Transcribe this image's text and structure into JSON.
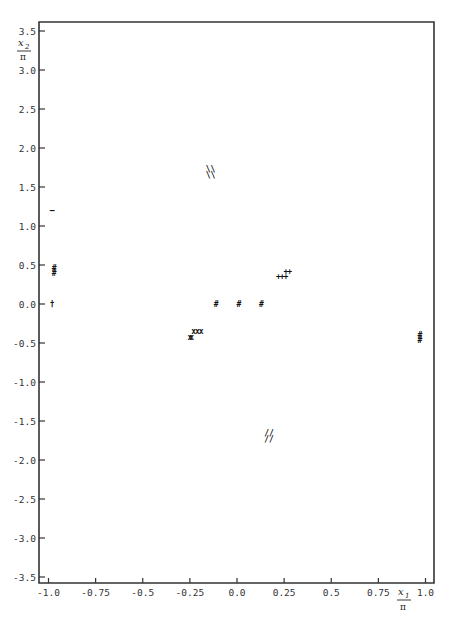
{
  "chart_data": {
    "type": "scatter",
    "title": "",
    "xlabel": "x1 / π",
    "ylabel": "x2 / π",
    "xlim": [
      -1.0,
      1.0
    ],
    "ylim": [
      -3.5,
      3.5
    ],
    "grid": false,
    "legend": null,
    "x_ticks": [
      "-1.0",
      "-0.75",
      "-0.5",
      "-0.25",
      "0.0",
      "0.25",
      "0.5",
      "0.75",
      "1.0"
    ],
    "x_tick_values": [
      -1.0,
      -0.75,
      -0.5,
      -0.25,
      0.0,
      0.25,
      0.5,
      0.75,
      1.0
    ],
    "y_ticks": [
      "3.5",
      "3.0",
      "2.5",
      "2.0",
      "1.5",
      "1.0",
      "0.5",
      "0.0",
      "-0.5",
      "-1.0",
      "-1.5",
      "-2.0",
      "-2.5",
      "-3.0",
      "-3.5"
    ],
    "y_tick_values": [
      3.5,
      3.0,
      2.5,
      2.0,
      1.5,
      1.0,
      0.5,
      0.0,
      -0.5,
      -1.0,
      -1.5,
      -2.0,
      -2.5,
      -3.0,
      -3.5
    ],
    "series": [
      {
        "name": "dash",
        "symbol": "–",
        "points": [
          {
            "x": -0.98,
            "y": 1.2
          }
        ]
      },
      {
        "name": "hash-left",
        "symbol": "#",
        "points": [
          {
            "x": -0.97,
            "y": 0.46
          },
          {
            "x": -0.97,
            "y": 0.4
          }
        ]
      },
      {
        "name": "dagger",
        "symbol": "†",
        "points": [
          {
            "x": -0.98,
            "y": 0.0
          }
        ]
      },
      {
        "name": "double-slash-upper",
        "symbol": "\\\\",
        "points": [
          {
            "x": -0.14,
            "y": 1.73
          },
          {
            "x": -0.14,
            "y": 1.66
          }
        ]
      },
      {
        "name": "cross-upper",
        "symbol": "x",
        "points": [
          {
            "x": -0.23,
            "y": -0.35
          },
          {
            "x": -0.21,
            "y": -0.35
          },
          {
            "x": -0.19,
            "y": -0.35
          }
        ]
      },
      {
        "name": "cross-lower",
        "symbol": "x",
        "points": [
          {
            "x": -0.25,
            "y": -0.42
          },
          {
            "x": -0.24,
            "y": -0.42
          }
        ]
      },
      {
        "name": "hash-center",
        "symbol": "#",
        "points": [
          {
            "x": -0.11,
            "y": 0.0
          },
          {
            "x": 0.01,
            "y": 0.0
          },
          {
            "x": 0.13,
            "y": 0.0
          }
        ]
      },
      {
        "name": "plus",
        "symbol": "+",
        "points": [
          {
            "x": 0.22,
            "y": 0.36
          },
          {
            "x": 0.24,
            "y": 0.36
          },
          {
            "x": 0.26,
            "y": 0.36
          },
          {
            "x": 0.26,
            "y": 0.42
          },
          {
            "x": 0.28,
            "y": 0.42
          }
        ]
      },
      {
        "name": "double-slash-lower",
        "symbol": "//",
        "points": [
          {
            "x": 0.17,
            "y": -1.65
          },
          {
            "x": 0.17,
            "y": -1.73
          }
        ]
      },
      {
        "name": "hash-right",
        "symbol": "#",
        "points": [
          {
            "x": 0.97,
            "y": -0.4
          },
          {
            "x": 0.97,
            "y": -0.46
          }
        ]
      }
    ]
  },
  "axes": {
    "x_label_top": "x",
    "x_label_sub": "1",
    "y_label_top": "x",
    "y_label_sub": "2",
    "pi": "π"
  }
}
